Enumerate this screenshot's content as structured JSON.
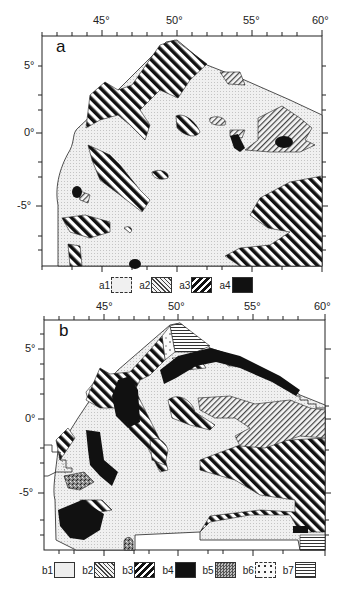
{
  "figure": {
    "panels": [
      {
        "id": "a",
        "letter": "a",
        "x_ticks": [
          "45°",
          "50°",
          "55°",
          "60°"
        ],
        "y_ticks": [
          "5°",
          "0°",
          "-5°"
        ],
        "legend": [
          {
            "key": "a1",
            "pattern": "fine-dot"
          },
          {
            "key": "a2",
            "pattern": "fine-diagonal"
          },
          {
            "key": "a3",
            "pattern": "bold-diagonal"
          },
          {
            "key": "a4",
            "pattern": "solid-black"
          }
        ]
      },
      {
        "id": "b",
        "letter": "b",
        "x_ticks": [
          "45°",
          "50°",
          "55°",
          "60°"
        ],
        "y_ticks": [
          "5°",
          "0°",
          "-5°"
        ],
        "legend": [
          {
            "key": "b1",
            "pattern": "fine-dot"
          },
          {
            "key": "b2",
            "pattern": "fine-diagonal"
          },
          {
            "key": "b3",
            "pattern": "bold-diagonal"
          },
          {
            "key": "b4",
            "pattern": "solid-black"
          },
          {
            "key": "b5",
            "pattern": "dense-stipple"
          },
          {
            "key": "b6",
            "pattern": "sparse-dots"
          },
          {
            "key": "b7",
            "pattern": "horizontal-lines"
          }
        ]
      }
    ],
    "colors": {
      "ink": "#111111",
      "background": "#ffffff",
      "light_fill": "#e8e8e8"
    }
  }
}
